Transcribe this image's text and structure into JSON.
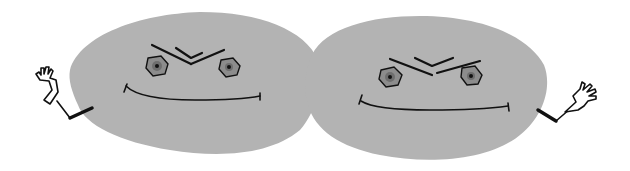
{
  "illustration": {
    "subject": "Two grey blob characters with frowning brows, smiles and waving hands",
    "characters": [
      {
        "name": "left-blob",
        "waving_hand_side": "left",
        "expression": "stern smile"
      },
      {
        "name": "right-blob",
        "waving_hand_side": "right",
        "expression": "stern smile"
      }
    ],
    "colors": {
      "body": "#b3b3b3",
      "eye_ring": "#8c8c8c",
      "eye_inner": "#6e6e6e",
      "pupil": "#111111",
      "ink": "#111111",
      "hand": "#ffffff",
      "background": "#ffffff"
    }
  }
}
